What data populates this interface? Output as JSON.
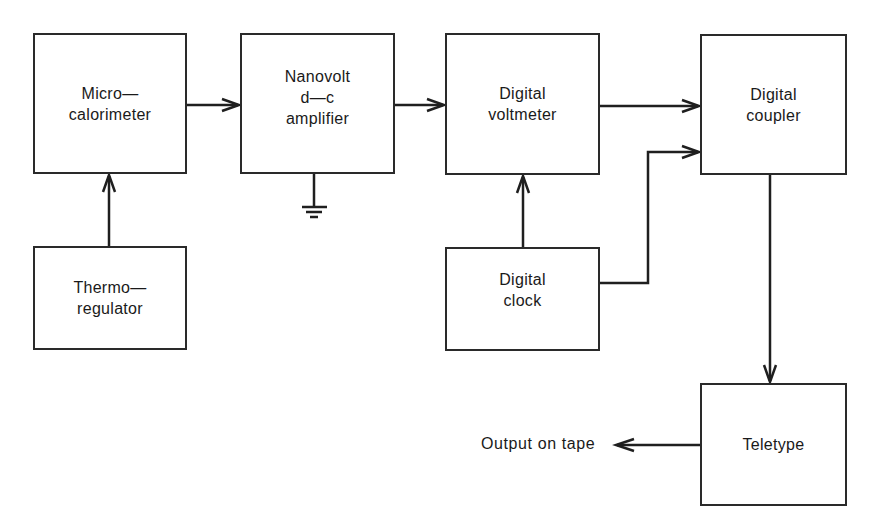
{
  "diagram": {
    "type": "block-diagram",
    "blocks": [
      {
        "id": "microcalorimeter",
        "label": "Micro—\ncalorimeter"
      },
      {
        "id": "nanovolt",
        "label": "Nanovolt\nd—c\namplifier"
      },
      {
        "id": "voltmeter",
        "label": "Digital\nvoltmeter"
      },
      {
        "id": "coupler",
        "label": "Digital\ncoupler"
      },
      {
        "id": "thermoregulator",
        "label": "Thermo—\nregulator"
      },
      {
        "id": "clock",
        "label": "Digital\nclock"
      },
      {
        "id": "teletype",
        "label": "Teletype"
      }
    ],
    "connections": [
      {
        "from": "thermoregulator",
        "to": "microcalorimeter"
      },
      {
        "from": "microcalorimeter",
        "to": "nanovolt"
      },
      {
        "from": "nanovolt",
        "to": "voltmeter"
      },
      {
        "from": "nanovolt",
        "to": "ground"
      },
      {
        "from": "clock",
        "to": "voltmeter"
      },
      {
        "from": "voltmeter",
        "to": "coupler"
      },
      {
        "from": "clock",
        "to": "coupler"
      },
      {
        "from": "coupler",
        "to": "teletype"
      },
      {
        "from": "teletype",
        "to": "output"
      }
    ],
    "output_label": "Output on tape",
    "line_color": "#1f1f1f"
  }
}
